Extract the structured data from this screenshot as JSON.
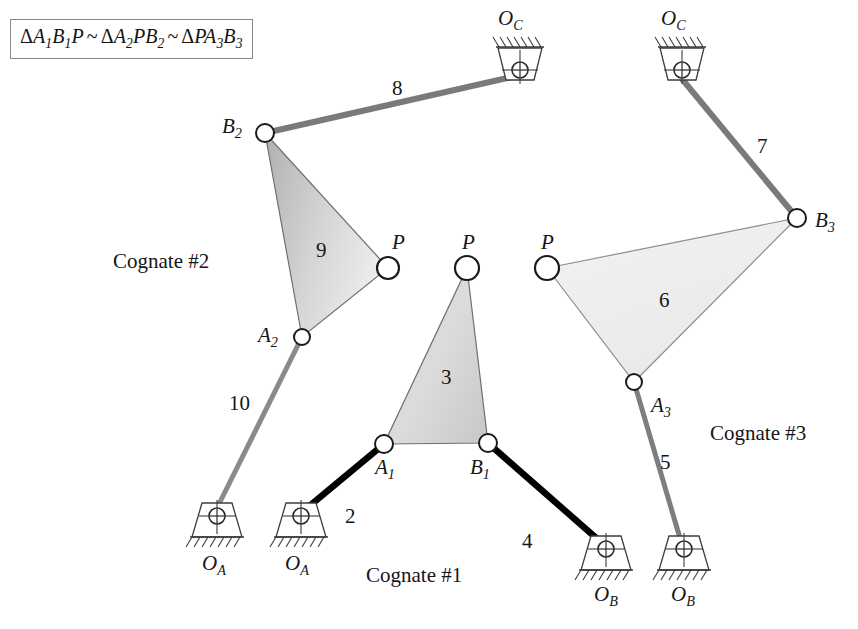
{
  "figure": {
    "formula": {
      "full_text": "ΔA1B1P ~ ΔA2PB2 ~ ΔPA3B3",
      "parts": [
        {
          "delta": "Δ",
          "letters": "A",
          "sub1": "1",
          "letters2": "B",
          "sub2": "1",
          "tail": "P"
        },
        {
          "delta": "Δ",
          "letters": "A",
          "sub1": "2",
          "letters2": "PB",
          "sub2": "2",
          "tail": ""
        },
        {
          "delta": "Δ",
          "letters": "PA",
          "sub1": "3",
          "letters2": "B",
          "sub2": "3",
          "tail": ""
        }
      ],
      "similar_symbol": "~"
    },
    "cognate_labels": [
      {
        "id": "cognate-2",
        "text": "Cognate #2",
        "x": 113,
        "y": 251
      },
      {
        "id": "cognate-1",
        "text": "Cognate #1",
        "x": 366,
        "y": 565
      },
      {
        "id": "cognate-3",
        "text": "Cognate #3",
        "x": 710,
        "y": 423
      }
    ],
    "link_numbers": [
      {
        "id": "link-8",
        "text": "8",
        "x": 392,
        "y": 78
      },
      {
        "id": "link-7",
        "text": "7",
        "x": 757,
        "y": 136
      },
      {
        "id": "link-9",
        "text": "9",
        "x": 316,
        "y": 240
      },
      {
        "id": "link-3",
        "text": "3",
        "x": 441,
        "y": 367
      },
      {
        "id": "link-6",
        "text": "6",
        "x": 659,
        "y": 290
      },
      {
        "id": "link-10",
        "text": "10",
        "x": 229,
        "y": 393
      },
      {
        "id": "link-2",
        "text": "2",
        "x": 345,
        "y": 506
      },
      {
        "id": "link-4",
        "text": "4",
        "x": 522,
        "y": 531
      },
      {
        "id": "link-5",
        "text": "5",
        "x": 660,
        "y": 452
      }
    ],
    "joint_labels": [
      {
        "id": "B2",
        "base": "B",
        "sub": "2",
        "x": 222,
        "y": 116
      },
      {
        "id": "P-cognate2",
        "base": "P",
        "sub": "",
        "x": 392,
        "y": 232
      },
      {
        "id": "A2",
        "base": "A",
        "sub": "2",
        "x": 258,
        "y": 325
      },
      {
        "id": "P-cognate1",
        "base": "P",
        "sub": "",
        "x": 462,
        "y": 232
      },
      {
        "id": "A1",
        "base": "A",
        "sub": "1",
        "x": 375,
        "y": 457
      },
      {
        "id": "B1",
        "base": "B",
        "sub": "1",
        "x": 470,
        "y": 457
      },
      {
        "id": "P-cognate3",
        "base": "P",
        "sub": "",
        "x": 541,
        "y": 232
      },
      {
        "id": "B3",
        "base": "B",
        "sub": "3",
        "x": 815,
        "y": 210
      },
      {
        "id": "A3",
        "base": "A",
        "sub": "3",
        "x": 651,
        "y": 395
      }
    ],
    "ground_labels": [
      {
        "id": "OC-left",
        "base": "O",
        "sub": "C",
        "x": 498,
        "y": 8
      },
      {
        "id": "OC-right",
        "base": "O",
        "sub": "C",
        "x": 661,
        "y": 8
      },
      {
        "id": "OA-left",
        "base": "O",
        "sub": "A",
        "x": 202,
        "y": 553
      },
      {
        "id": "OA-right",
        "base": "O",
        "sub": "A",
        "x": 285,
        "y": 553
      },
      {
        "id": "OB-left",
        "base": "O",
        "sub": "B",
        "x": 594,
        "y": 584
      },
      {
        "id": "OB-right",
        "base": "O",
        "sub": "B",
        "x": 671,
        "y": 584
      }
    ],
    "nodes": [
      {
        "id": "B2",
        "x": 265,
        "y": 133,
        "r": 9
      },
      {
        "id": "P2",
        "x": 388,
        "y": 268,
        "r": 11
      },
      {
        "id": "A2",
        "x": 302,
        "y": 337,
        "r": 8
      },
      {
        "id": "P1",
        "x": 467,
        "y": 268,
        "r": 12
      },
      {
        "id": "A1",
        "x": 384,
        "y": 444,
        "r": 9
      },
      {
        "id": "B1",
        "x": 488,
        "y": 443,
        "r": 9
      },
      {
        "id": "P3",
        "x": 547,
        "y": 268,
        "r": 12
      },
      {
        "id": "B3",
        "x": 797,
        "y": 218,
        "r": 9
      },
      {
        "id": "A3",
        "x": 634,
        "y": 382,
        "r": 8
      }
    ],
    "supports": [
      {
        "id": "OC-left",
        "x": 520,
        "y": 55,
        "orientation": "top"
      },
      {
        "id": "OC-right",
        "x": 682,
        "y": 55,
        "orientation": "top"
      },
      {
        "id": "OA-left",
        "x": 216,
        "y": 518,
        "orientation": "bottom"
      },
      {
        "id": "OA-right",
        "x": 299,
        "y": 518,
        "orientation": "bottom"
      },
      {
        "id": "OB-left",
        "x": 606,
        "y": 551,
        "orientation": "bottom"
      },
      {
        "id": "OB-right",
        "x": 684,
        "y": 551,
        "orientation": "bottom"
      }
    ],
    "links": [
      {
        "id": "link-8",
        "from": "B2",
        "to": "OC-left",
        "x1": 265,
        "y1": 133,
        "x2": 516,
        "y2": 76,
        "style": "gray",
        "width": 6
      },
      {
        "id": "link-7",
        "from": "OC-right",
        "to": "B3",
        "x1": 682,
        "y1": 79,
        "x2": 797,
        "y2": 218,
        "style": "gray",
        "width": 6
      },
      {
        "id": "link-10",
        "from": "A2",
        "to": "OA-left",
        "x1": 302,
        "y1": 337,
        "x2": 217,
        "y2": 508,
        "style": "gray",
        "width": 5
      },
      {
        "id": "link-2",
        "from": "OA-right",
        "to": "A1",
        "x1": 301,
        "y1": 513,
        "x2": 384,
        "y2": 444,
        "style": "black",
        "width": 6
      },
      {
        "id": "link-4",
        "from": "B1",
        "to": "OB-left",
        "x1": 488,
        "y1": 443,
        "x2": 603,
        "y2": 544,
        "style": "black",
        "width": 6
      },
      {
        "id": "link-5",
        "from": "A3",
        "to": "OB-right",
        "x1": 634,
        "y1": 382,
        "x2": 682,
        "y2": 545,
        "style": "gray",
        "width": 5
      }
    ],
    "triangles": [
      {
        "id": "tri-9",
        "label": "9",
        "fill_from": "#b8b8b8",
        "fill_to": "#e8e8e8",
        "points": "265,133 388,268 302,337"
      },
      {
        "id": "tri-3",
        "label": "3",
        "fill_from": "#c6c6c6",
        "fill_to": "#e2e2e2",
        "points": "467,268 488,443 384,444"
      },
      {
        "id": "tri-6",
        "label": "6",
        "fill_from": "#ededed",
        "fill_to": "#f6f6f6",
        "points": "547,268 797,218 634,382"
      }
    ],
    "colors": {
      "ink": "#161616",
      "gray_link": "#7a7a7a",
      "black_link": "#000000",
      "node_stroke": "#1a1a1a",
      "node_fill": "#ffffff",
      "support_stroke": "#3c3c3c",
      "box_border": "#8a8a8a",
      "background": "#ffffff"
    }
  }
}
